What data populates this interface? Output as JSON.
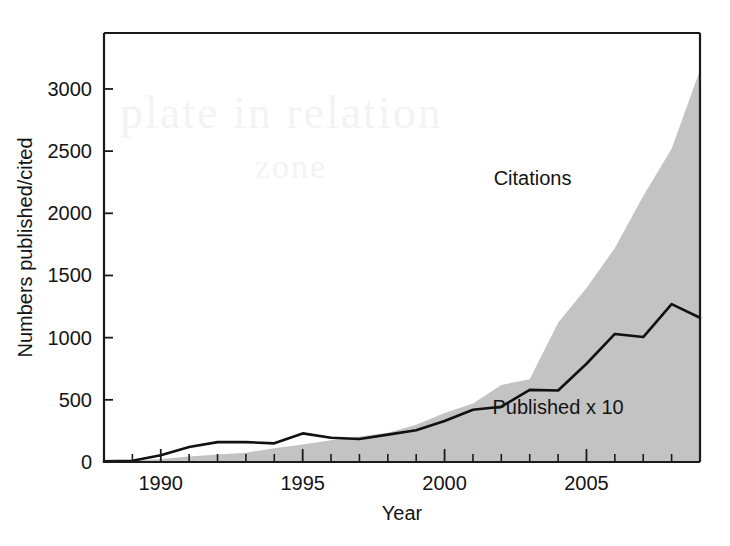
{
  "figure": {
    "background_color": "#ffffff",
    "ink_color": "#141414",
    "area_fill_color": "#c3c3c3",
    "line_color": "#111111",
    "width": 730,
    "height": 546
  },
  "chart_data": {
    "type": "area",
    "title": "",
    "subtitle": "",
    "xlabel": "Year",
    "ylabel": "Numbers published/cited",
    "xlim": [
      1988,
      2009
    ],
    "ylim": [
      0,
      3450
    ],
    "grid": false,
    "legend_position": "inline-annotations",
    "x_major_ticks": [
      1990,
      1995,
      2000,
      2005
    ],
    "x_major_tick_labels": [
      "1990",
      "1995",
      "2000",
      "2005"
    ],
    "x_minor_tick_step": 1,
    "y_ticks": [
      0,
      500,
      1000,
      1500,
      2000,
      2500,
      3000
    ],
    "y_tick_labels": [
      "0",
      "500",
      "1000",
      "1500",
      "2000",
      "2500",
      "3000"
    ],
    "x": [
      1988,
      1989,
      1990,
      1991,
      1992,
      1993,
      1994,
      1995,
      1996,
      1997,
      1998,
      1999,
      2000,
      2001,
      2002,
      2003,
      2004,
      2005,
      2006,
      2007,
      2008,
      2009
    ],
    "series": [
      {
        "name": "Citations",
        "render": "filled-area",
        "fill": "#c3c3c3",
        "annotation": "Citations",
        "annotation_x": 2003.1,
        "annotation_y": 2230,
        "values": [
          5,
          10,
          25,
          45,
          60,
          75,
          110,
          140,
          175,
          205,
          235,
          300,
          395,
          470,
          620,
          665,
          1120,
          1400,
          1720,
          2140,
          2520,
          3150
        ]
      },
      {
        "name": "Published x 10",
        "render": "line",
        "stroke": "#111111",
        "annotation": "Published x 10",
        "annotation_x": 2004.0,
        "annotation_y": 390,
        "values": [
          5,
          10,
          55,
          120,
          160,
          160,
          150,
          230,
          195,
          185,
          220,
          255,
          330,
          420,
          445,
          580,
          575,
          790,
          1030,
          1005,
          1270,
          1160
        ]
      }
    ],
    "annotations": [
      {
        "text": "Citations",
        "x": 2003.1,
        "y": 2230
      },
      {
        "text": "Published x 10",
        "x": 2004.0,
        "y": 390
      }
    ]
  }
}
